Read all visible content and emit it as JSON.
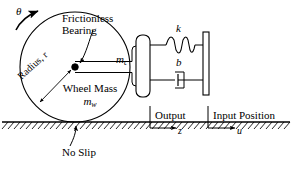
{
  "diagram": {
    "type": "mechanical-schematic",
    "background_color": "#ffffff",
    "line_color": "#000000"
  },
  "labels": {
    "theta": "θ",
    "frictionless_line1": "Frictionless",
    "frictionless_line2": "Bearing",
    "radius": "Radius, r",
    "wheel_mass_line1": "Wheel Mass",
    "wheel_mass_symbol_base": "m",
    "wheel_mass_symbol_sub": "w",
    "cart_mass_base": "m",
    "cart_mass_sub": "c",
    "spring": "k",
    "damper": "b",
    "no_slip": "No Slip",
    "output": "Output",
    "output_symbol": "z",
    "input": "Input Position",
    "input_symbol": "u"
  },
  "components": {
    "wheel": {
      "name": "wheel",
      "center_x": 75,
      "center_y": 67,
      "radius": 55,
      "stroke": "#000000"
    },
    "bearing": {
      "name": "frictionless-bearing",
      "x": 75,
      "y": 67,
      "dot_radius": 3.2
    },
    "ground": {
      "name": "ground-hatching",
      "y": 122,
      "x_start": 2,
      "x_end": 290,
      "hatch_count": 46
    },
    "mass_block": {
      "name": "cart-mass-block",
      "x": 136,
      "y": 35,
      "width": 14,
      "height": 62
    },
    "wall": {
      "name": "input-wall",
      "x": 203,
      "y": 32,
      "width": 6,
      "height": 63
    },
    "spring": {
      "name": "spring-element",
      "y": 45,
      "x_start": 150,
      "x_end": 203,
      "coils": 4
    },
    "damper": {
      "name": "damper-element",
      "y": 80,
      "x_start": 150,
      "x_end": 203
    }
  },
  "arrows": {
    "theta_direction": "counterclockwise-up-right",
    "radius_style": "double-headed",
    "output_direction": "right",
    "input_direction": "right",
    "no_slip_target": "contact-point"
  }
}
